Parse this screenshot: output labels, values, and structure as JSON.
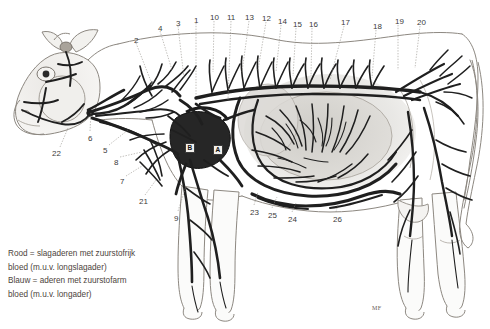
{
  "figure": {
    "background_color": "#ffffff",
    "ink_color": "#2b2b2b"
  },
  "legend": {
    "lines": [
      "Rood = slagaderen met zuurstofrijk",
      "bloed (m.u.v. longslagader)",
      "Blauw = aderen met zuurstofarm",
      "bloed (m.u.v. longader)"
    ]
  },
  "signature": {
    "text": "MF"
  },
  "heart_labels": [
    {
      "id": "B",
      "text": "B",
      "x": 185,
      "y": 143
    },
    {
      "id": "A",
      "text": "A",
      "x": 213,
      "y": 145
    }
  ],
  "number_labels": [
    {
      "text": "2",
      "x": 134,
      "y": 37
    },
    {
      "text": "4",
      "x": 158,
      "y": 25
    },
    {
      "text": "3",
      "x": 176,
      "y": 20
    },
    {
      "text": "1",
      "x": 194,
      "y": 17
    },
    {
      "text": "10",
      "x": 210,
      "y": 14
    },
    {
      "text": "11",
      "x": 227,
      "y": 14
    },
    {
      "text": "13",
      "x": 245,
      "y": 14
    },
    {
      "text": "12",
      "x": 262,
      "y": 15
    },
    {
      "text": "14",
      "x": 278,
      "y": 18
    },
    {
      "text": "15",
      "x": 293,
      "y": 21
    },
    {
      "text": "16",
      "x": 309,
      "y": 21
    },
    {
      "text": "17",
      "x": 341,
      "y": 19
    },
    {
      "text": "18",
      "x": 373,
      "y": 23
    },
    {
      "text": "19",
      "x": 395,
      "y": 18
    },
    {
      "text": "20",
      "x": 417,
      "y": 19
    },
    {
      "text": "22",
      "x": 52,
      "y": 150
    },
    {
      "text": "6",
      "x": 88,
      "y": 135
    },
    {
      "text": "5",
      "x": 103,
      "y": 147
    },
    {
      "text": "8",
      "x": 114,
      "y": 159
    },
    {
      "text": "7",
      "x": 120,
      "y": 178
    },
    {
      "text": "21",
      "x": 139,
      "y": 198
    },
    {
      "text": "9",
      "x": 174,
      "y": 215
    },
    {
      "text": "23",
      "x": 250,
      "y": 209
    },
    {
      "text": "25",
      "x": 268,
      "y": 212
    },
    {
      "text": "24",
      "x": 288,
      "y": 216
    },
    {
      "text": "26",
      "x": 333,
      "y": 216
    }
  ],
  "leader_lines": [
    {
      "x1": 136,
      "y1": 43,
      "x2": 152,
      "y2": 84
    },
    {
      "x1": 160,
      "y1": 31,
      "x2": 172,
      "y2": 70
    },
    {
      "x1": 178,
      "y1": 26,
      "x2": 184,
      "y2": 78
    },
    {
      "x1": 196,
      "y1": 23,
      "x2": 196,
      "y2": 96
    },
    {
      "x1": 214,
      "y1": 21,
      "x2": 213,
      "y2": 72
    },
    {
      "x1": 231,
      "y1": 21,
      "x2": 228,
      "y2": 100
    },
    {
      "x1": 249,
      "y1": 21,
      "x2": 242,
      "y2": 72
    },
    {
      "x1": 266,
      "y1": 22,
      "x2": 258,
      "y2": 70
    },
    {
      "x1": 281,
      "y1": 25,
      "x2": 276,
      "y2": 72
    },
    {
      "x1": 296,
      "y1": 28,
      "x2": 293,
      "y2": 76
    },
    {
      "x1": 312,
      "y1": 28,
      "x2": 311,
      "y2": 76
    },
    {
      "x1": 344,
      "y1": 26,
      "x2": 330,
      "y2": 80
    },
    {
      "x1": 376,
      "y1": 30,
      "x2": 372,
      "y2": 78
    },
    {
      "x1": 398,
      "y1": 25,
      "x2": 398,
      "y2": 70
    },
    {
      "x1": 420,
      "y1": 26,
      "x2": 415,
      "y2": 68
    },
    {
      "x1": 60,
      "y1": 147,
      "x2": 68,
      "y2": 128
    },
    {
      "x1": 90,
      "y1": 131,
      "x2": 91,
      "y2": 112
    },
    {
      "x1": 109,
      "y1": 145,
      "x2": 128,
      "y2": 130
    },
    {
      "x1": 120,
      "y1": 157,
      "x2": 142,
      "y2": 152
    },
    {
      "x1": 126,
      "y1": 176,
      "x2": 142,
      "y2": 166
    },
    {
      "x1": 145,
      "y1": 195,
      "x2": 156,
      "y2": 180
    },
    {
      "x1": 178,
      "y1": 211,
      "x2": 186,
      "y2": 186
    },
    {
      "x1": 254,
      "y1": 205,
      "x2": 258,
      "y2": 192
    },
    {
      "x1": 272,
      "y1": 208,
      "x2": 277,
      "y2": 197
    },
    {
      "x1": 292,
      "y1": 212,
      "x2": 296,
      "y2": 203
    },
    {
      "x1": 336,
      "y1": 212,
      "x2": 338,
      "y2": 204
    }
  ]
}
